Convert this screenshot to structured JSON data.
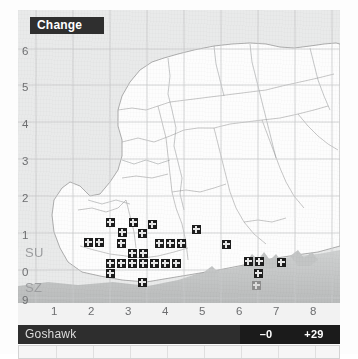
{
  "panel": {
    "title_chip": "Change",
    "species": "Goshawk",
    "stats": {
      "loss_label": "–0",
      "same_label": "0",
      "gain_label": "+29"
    },
    "colors": {
      "chip_bg": "#2f2f2f",
      "footer_bg": "#2e2e2e",
      "stat_dark_bg": "#1b1b1b",
      "stat_light_bg": "#b9b9b9",
      "marker_present": "#1d1d1d",
      "marker_faded": "#8e8e8e",
      "land": "#fdfdfd",
      "sea": "#c6c8c8",
      "backdrop": "#e9eaea"
    }
  },
  "axes": {
    "y_labels": [
      "6",
      "5",
      "4",
      "3",
      "2",
      "1",
      "0",
      "9"
    ],
    "x_labels": [
      "1",
      "2",
      "3",
      "4",
      "5",
      "6",
      "7",
      "8"
    ],
    "square_labels": [
      "SU",
      "SZ"
    ]
  },
  "chart_data": {
    "type": "scatter",
    "title": "Change",
    "subtitle": "Goshawk",
    "xlabel": "",
    "ylabel": "",
    "grid": true,
    "legend_position": "none",
    "xlim": [
      0,
      9
    ],
    "ylim": [
      9,
      7
    ],
    "x": [
      "1",
      "2",
      "3",
      "4",
      "5",
      "6",
      "7",
      "8"
    ],
    "y": [
      "6",
      "5",
      "4",
      "3",
      "2",
      "1",
      "0",
      "9"
    ],
    "grid_square_labels": [
      "SU",
      "SZ"
    ],
    "summary": {
      "losses": "–0",
      "unchanged": "0",
      "gains": "+29"
    },
    "series": [
      {
        "name": "gain",
        "marker": "filled-square-with-cross",
        "count": 28,
        "points": [
          [
            92,
            212
          ],
          [
            115,
            212
          ],
          [
            134,
            214
          ],
          [
            104,
            222
          ],
          [
            124,
            223
          ],
          [
            178,
            219
          ],
          [
            70,
            232
          ],
          [
            81,
            232
          ],
          [
            103,
            233
          ],
          [
            141,
            233
          ],
          [
            152,
            233
          ],
          [
            163,
            233
          ],
          [
            208,
            234
          ],
          [
            114,
            243
          ],
          [
            125,
            243
          ],
          [
            92,
            253
          ],
          [
            103,
            253
          ],
          [
            114,
            253
          ],
          [
            125,
            253
          ],
          [
            136,
            253
          ],
          [
            147,
            253
          ],
          [
            158,
            253
          ],
          [
            230,
            251
          ],
          [
            241,
            251
          ],
          [
            263,
            252
          ],
          [
            92,
            263
          ],
          [
            240,
            263
          ],
          [
            124,
            272
          ]
        ]
      },
      {
        "name": "gain-faded",
        "marker": "grey-square-with-cross",
        "count": 1,
        "points": [
          [
            238,
            275
          ]
        ]
      }
    ]
  }
}
